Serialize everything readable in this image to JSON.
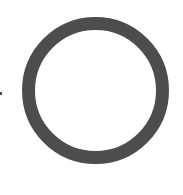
{
  "shapes": {
    "ring": {
      "icon": "circle-ring-icon",
      "color": "#4d4d4d"
    },
    "dot": {
      "icon": "dot-icon",
      "color": "#4a4a4a"
    }
  }
}
